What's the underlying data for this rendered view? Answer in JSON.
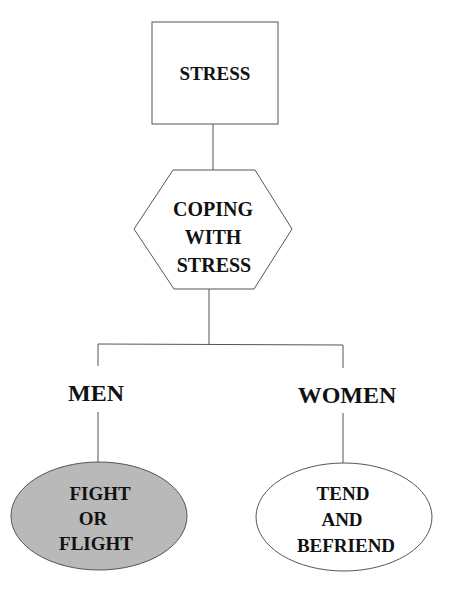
{
  "diagram": {
    "root": {
      "label": "STRESS",
      "shape": "rectangle"
    },
    "coping": {
      "lines": [
        "COPING",
        "WITH",
        "STRESS"
      ],
      "shape": "hexagon"
    },
    "branches": [
      {
        "label": "MEN",
        "outcome": {
          "lines": [
            "FIGHT",
            "OR",
            "FLIGHT"
          ],
          "shape": "ellipse",
          "fill": "#b9b9b9"
        }
      },
      {
        "label": "WOMEN",
        "outcome": {
          "lines": [
            "TEND",
            "AND",
            "BEFRIEND"
          ],
          "shape": "ellipse",
          "fill": "#ffffff"
        }
      }
    ],
    "colors": {
      "stroke": "#555555",
      "text": "#111111"
    }
  }
}
